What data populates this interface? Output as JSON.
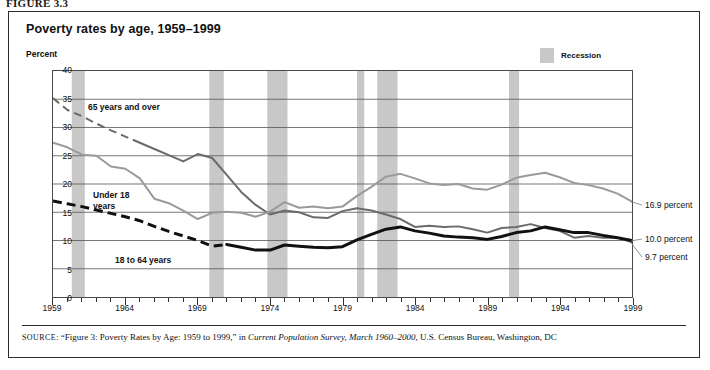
{
  "figure_label": "FIGURE 3.3",
  "title": "Poverty rates by age, 1959–1999",
  "y_axis_title": "Percent",
  "legend": {
    "swatch_color": "#c8c8c8",
    "label": "Recession"
  },
  "source": {
    "prefix": "SOURCE",
    "text_1": ": “Figure 3: Poverty Rates by Age: 1959 to 1999,” in ",
    "italic_1": "Current Population Survey, March 1960–2000",
    "text_2": ", U.S. Census Bureau, Washington, DC"
  },
  "annotations": [
    {
      "name": "label-65-and-over",
      "text": "65 years and over",
      "x": 88,
      "y": 102
    },
    {
      "name": "label-under-18",
      "text": "Under 18\nyears",
      "x": 93,
      "y": 190
    },
    {
      "name": "label-18-to-64",
      "text": "18 to 64 years",
      "x": 115,
      "y": 255
    }
  ],
  "end_labels": [
    {
      "name": "end-label-under-18",
      "text": "16.9 percent",
      "x": 645,
      "y": 200
    },
    {
      "name": "end-label-18-to-64",
      "text": "10.0 percent",
      "x": 645,
      "y": 234
    },
    {
      "name": "end-label-65-over",
      "text": "9.7 percent",
      "x": 645,
      "y": 252
    }
  ],
  "chart_data": {
    "type": "line",
    "title": "Poverty rates by age, 1959–1999",
    "xlabel": "",
    "ylabel": "Percent",
    "ylim": [
      0,
      40
    ],
    "xlim": [
      1959,
      1999
    ],
    "ytick_values": [
      0,
      5,
      10,
      15,
      20,
      25,
      30,
      35,
      40
    ],
    "xtick_values": [
      1959,
      1964,
      1969,
      1974,
      1979,
      1984,
      1989,
      1994,
      1999
    ],
    "grid": true,
    "legend_position": "top-right",
    "x": [
      1959,
      1960,
      1961,
      1962,
      1963,
      1964,
      1965,
      1966,
      1967,
      1968,
      1969,
      1970,
      1971,
      1972,
      1973,
      1974,
      1975,
      1976,
      1977,
      1978,
      1979,
      1980,
      1981,
      1982,
      1983,
      1984,
      1985,
      1986,
      1987,
      1988,
      1989,
      1990,
      1991,
      1992,
      1993,
      1994,
      1995,
      1996,
      1997,
      1998,
      1999
    ],
    "series": [
      {
        "name": "65 years and over",
        "color": "#6b6b6b",
        "style": "dashed-then-solid",
        "dashed_through": 1965,
        "final_value": 9.7,
        "values": [
          35.2,
          33.1,
          32.0,
          30.7,
          29.5,
          28.4,
          27.3,
          26.2,
          25.1,
          24.0,
          25.3,
          24.6,
          21.6,
          18.6,
          16.3,
          14.6,
          15.3,
          15.0,
          14.1,
          14.0,
          15.2,
          15.7,
          15.3,
          14.6,
          13.8,
          12.4,
          12.6,
          12.4,
          12.5,
          12.0,
          11.4,
          12.2,
          12.4,
          12.9,
          12.2,
          11.7,
          10.5,
          10.8,
          10.5,
          10.5,
          9.7
        ]
      },
      {
        "name": "Under 18 years",
        "color": "#9a9a9a",
        "style": "solid",
        "final_value": 16.9,
        "values": [
          27.3,
          26.5,
          25.2,
          25.0,
          23.1,
          22.7,
          21.0,
          17.4,
          16.6,
          15.3,
          13.8,
          14.9,
          15.1,
          14.9,
          14.2,
          15.1,
          16.8,
          15.8,
          16.0,
          15.7,
          16.0,
          17.9,
          19.5,
          21.3,
          21.8,
          21.0,
          20.1,
          19.8,
          20.0,
          19.2,
          19.0,
          19.9,
          21.1,
          21.6,
          22.0,
          21.2,
          20.2,
          19.8,
          19.2,
          18.3,
          16.9
        ]
      },
      {
        "name": "18 to 64 years",
        "color": "#111111",
        "style": "dashed-then-solid",
        "dashed_through": 1971,
        "final_value": 10.0,
        "values": [
          17.0,
          16.5,
          16.0,
          15.4,
          14.8,
          14.2,
          13.5,
          12.5,
          11.6,
          10.8,
          10.0,
          9.0,
          9.3,
          8.8,
          8.3,
          8.3,
          9.2,
          9.0,
          8.8,
          8.7,
          8.9,
          10.1,
          11.1,
          12.0,
          12.4,
          11.7,
          11.3,
          10.8,
          10.6,
          10.5,
          10.2,
          10.7,
          11.4,
          11.7,
          12.4,
          11.9,
          11.4,
          11.4,
          10.9,
          10.5,
          10.0
        ]
      }
    ],
    "recession_bands": [
      {
        "start": 1960.3,
        "end": 1961.2
      },
      {
        "start": 1969.8,
        "end": 1970.8
      },
      {
        "start": 1973.8,
        "end": 1975.2
      },
      {
        "start": 1980.0,
        "end": 1980.5
      },
      {
        "start": 1981.4,
        "end": 1982.8
      },
      {
        "start": 1990.5,
        "end": 1991.2
      }
    ],
    "band_color": "#c8c8c8"
  }
}
